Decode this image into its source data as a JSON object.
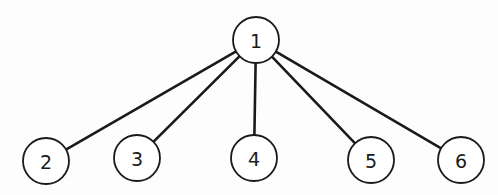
{
  "diagram": {
    "type": "tree",
    "root": "1",
    "nodes": [
      {
        "id": "1",
        "label": "1"
      },
      {
        "id": "2",
        "label": "2"
      },
      {
        "id": "3",
        "label": "3"
      },
      {
        "id": "4",
        "label": "4"
      },
      {
        "id": "5",
        "label": "5"
      },
      {
        "id": "6",
        "label": "6"
      }
    ],
    "edges": [
      {
        "from": "1",
        "to": "2"
      },
      {
        "from": "1",
        "to": "3"
      },
      {
        "from": "1",
        "to": "4"
      },
      {
        "from": "1",
        "to": "5"
      },
      {
        "from": "1",
        "to": "6"
      }
    ],
    "colors": {
      "stroke": "#1a1a1a",
      "fill": "#ffffff"
    }
  }
}
